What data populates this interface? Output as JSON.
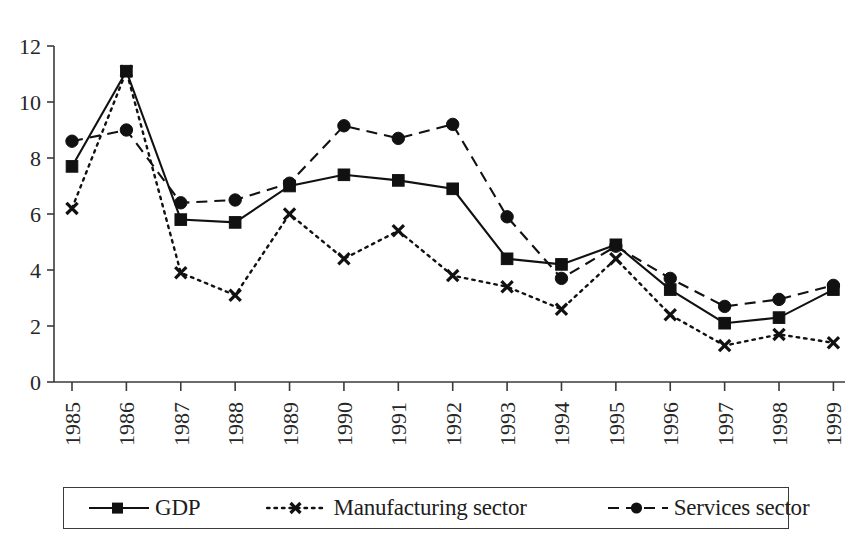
{
  "chart_data": {
    "type": "line",
    "title": "",
    "xlabel": "",
    "ylabel": "",
    "ylim": [
      0,
      12
    ],
    "ytick_step": 2,
    "grid": false,
    "legend_position": "bottom",
    "categories": [
      "1985",
      "1986",
      "1987",
      "1988",
      "1989",
      "1990",
      "1991",
      "1992",
      "1993",
      "1994",
      "1995",
      "1996",
      "1997",
      "1998",
      "1999"
    ],
    "yticks": [
      "0",
      "2",
      "4",
      "6",
      "8",
      "10",
      "12"
    ],
    "series": [
      {
        "name": "GDP",
        "marker": "square",
        "linestyle": "solid",
        "color": "#111111",
        "values": [
          7.7,
          11.1,
          5.8,
          5.7,
          7.0,
          7.4,
          7.2,
          6.9,
          4.4,
          4.2,
          4.9,
          3.3,
          2.1,
          2.3,
          3.3
        ]
      },
      {
        "name": "Manufacturing sector",
        "marker": "x",
        "linestyle": "dotted",
        "color": "#111111",
        "values": [
          6.2,
          11.1,
          3.9,
          3.1,
          6.0,
          4.4,
          5.4,
          3.8,
          3.4,
          2.6,
          4.4,
          2.4,
          1.3,
          1.7,
          1.4
        ]
      },
      {
        "name": "Services sector",
        "marker": "circle",
        "linestyle": "dashed",
        "color": "#111111",
        "values": [
          8.6,
          9.0,
          6.4,
          6.5,
          7.1,
          9.15,
          8.7,
          9.2,
          5.9,
          3.7,
          4.85,
          3.7,
          2.7,
          2.95,
          3.45
        ]
      }
    ]
  },
  "legend": {
    "items": [
      {
        "label": "GDP",
        "marker": "square-marker-icon",
        "linestyle": "solid"
      },
      {
        "label": "Manufacturing sector",
        "marker": "x-marker-icon",
        "linestyle": "dotted"
      },
      {
        "label": "Services sector",
        "marker": "circle-marker-icon",
        "linestyle": "dashed"
      }
    ]
  }
}
